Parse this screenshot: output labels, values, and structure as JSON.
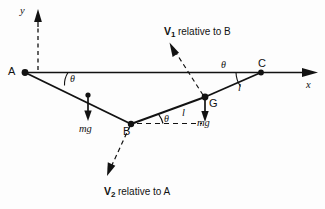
{
  "diagram": {
    "background_color": "#fdfdfd",
    "stroke_color": "#121212",
    "axes": {
      "y_label": "y",
      "x_label": "x"
    },
    "points": [
      {
        "id": "A",
        "label": "A"
      },
      {
        "id": "B",
        "label": "B"
      },
      {
        "id": "C",
        "label": "C"
      },
      {
        "id": "G",
        "label": "G"
      }
    ],
    "angles": [
      {
        "at": "A",
        "label": "θ"
      },
      {
        "at": "B",
        "label": "θ"
      },
      {
        "at": "C",
        "label": "θ"
      }
    ],
    "lengths": [
      {
        "segment": "B-G",
        "label": "l"
      },
      {
        "segment": "G-C",
        "label": "l"
      }
    ],
    "weights": [
      {
        "at": "midpoint-AB",
        "label": "mg"
      },
      {
        "at": "G",
        "label": "mg"
      }
    ],
    "velocity_vectors": [
      {
        "name": "V1",
        "symbol": "V",
        "subscript": "1",
        "qualifier": "relative to B",
        "origin": "G",
        "direction": "up-left"
      },
      {
        "name": "V2",
        "symbol": "V",
        "subscript": "2",
        "qualifier": "relative to A",
        "origin": "B",
        "direction": "down-left"
      }
    ]
  }
}
